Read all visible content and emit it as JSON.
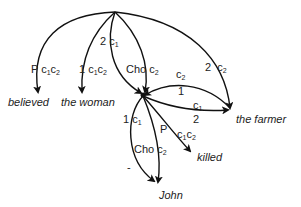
{
  "diagram": {
    "nodes": [
      {
        "id": "root",
        "label": ""
      },
      {
        "id": "hub",
        "label": ""
      },
      {
        "id": "believed",
        "label": "believed"
      },
      {
        "id": "the_woman",
        "label": "the woman"
      },
      {
        "id": "the_farmer",
        "label": "the farmer"
      },
      {
        "id": "killed",
        "label": "killed"
      },
      {
        "id": "john",
        "label": "John"
      }
    ],
    "edges": [
      {
        "from": "root",
        "to": "believed",
        "label": "P c1c2",
        "tag": "P",
        "sub": "c",
        "i1": "1",
        "i2": "2"
      },
      {
        "from": "root",
        "to": "the_woman",
        "label": "1 c1c2",
        "tag": "1",
        "sub": "c",
        "i1": "1",
        "i2": "2"
      },
      {
        "from": "root",
        "to": "hub",
        "label": "2 c1",
        "tag": "2",
        "i1": "1"
      },
      {
        "from": "root",
        "to": "hub",
        "label": "Cho c2",
        "tag": "Cho",
        "i2": "2"
      },
      {
        "from": "root",
        "to": "the_farmer",
        "label": "2 c2",
        "tag": "2",
        "i2": "2"
      },
      {
        "from": "hub",
        "to": "the_farmer",
        "label": "c2 1",
        "tag": "1",
        "i2": "2"
      },
      {
        "from": "hub",
        "to": "the_farmer",
        "label": "c1 2",
        "tag": "2",
        "i1": "1"
      },
      {
        "from": "hub",
        "to": "john",
        "label": "1 c1",
        "tag": "1",
        "i1": "1"
      },
      {
        "from": "hub",
        "to": "john",
        "label": "Cho c2",
        "tag": "Cho",
        "i2": "2"
      },
      {
        "from": "hub",
        "to": "killed",
        "label": "P c1c2",
        "tag": "P",
        "i1": "1",
        "i2": "2"
      }
    ],
    "words": {
      "believed": "believed",
      "the_woman": "the woman",
      "the_farmer": "the farmer",
      "killed": "killed",
      "john": "John"
    },
    "labels": {
      "p1_tag": "P",
      "c": "c",
      "one": "1",
      "two": "2",
      "cho": "Cho",
      "l_believed_tag": "P",
      "l_woman_tag": "1",
      "l_2c1_tag": "2",
      "l_cho_top": "Cho",
      "l_farmer_top_tag": "2",
      "l_farmer_mid_tag": "1",
      "l_farmer_low_tag": "2",
      "l_john_1_tag": "1",
      "l_john_cho": "Cho",
      "l_killed_tag": "P",
      "dash": "-"
    }
  }
}
